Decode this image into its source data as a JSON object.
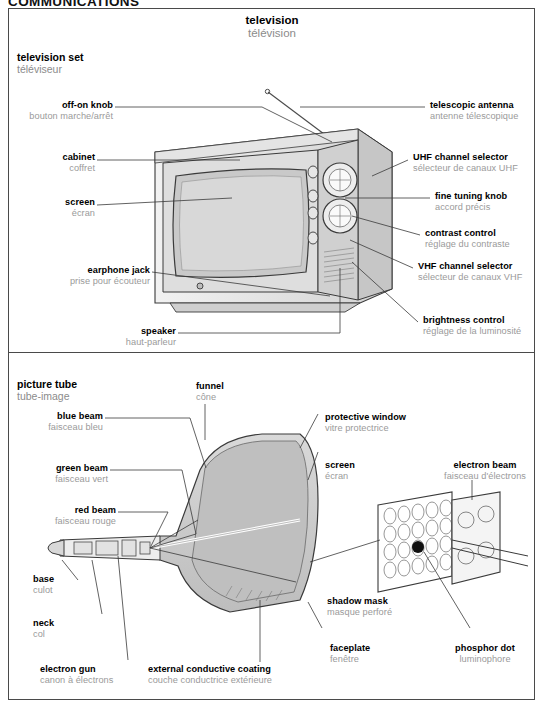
{
  "page": {
    "header": "COMMUNICATIONS",
    "title": {
      "en": "television",
      "fr": "télévision"
    }
  },
  "colors": {
    "ink": "#000000",
    "french": "#9a9a9a",
    "leader": "#3a3a3a",
    "frame": "#4a4a4a",
    "shade_light": "#e8e8e8",
    "shade_mid": "#cfcfcf",
    "shade_dark": "#a8a8a8",
    "screen_fill": "#d6d6d6"
  },
  "sections": [
    {
      "id": "television-set",
      "en": "television set",
      "fr": "téléviseur"
    },
    {
      "id": "picture-tube",
      "en": "picture tube",
      "fr": "tube-image"
    }
  ],
  "television_set": {
    "labels": [
      {
        "id": "off-on-knob",
        "en": "off-on knob",
        "fr": "bouton marche/arrêt",
        "side": "left"
      },
      {
        "id": "cabinet",
        "en": "cabinet",
        "fr": "coffret",
        "side": "left"
      },
      {
        "id": "screen",
        "en": "screen",
        "fr": "écran",
        "side": "left"
      },
      {
        "id": "earphone-jack",
        "en": "earphone jack",
        "fr": "prise pour écouteur",
        "side": "left"
      },
      {
        "id": "speaker",
        "en": "speaker",
        "fr": "haut-parleur",
        "side": "left"
      },
      {
        "id": "telescopic-antenna",
        "en": "telescopic antenna",
        "fr": "antenne télescopique",
        "side": "right"
      },
      {
        "id": "uhf-channel-selector",
        "en": "UHF channel selector",
        "fr": "sélecteur de canaux UHF",
        "side": "right"
      },
      {
        "id": "fine-tuning-knob",
        "en": "fine tuning knob",
        "fr": "accord précis",
        "side": "right"
      },
      {
        "id": "contrast-control",
        "en": "contrast control",
        "fr": "réglage du contraste",
        "side": "right"
      },
      {
        "id": "vhf-channel-selector",
        "en": "VHF channel selector",
        "fr": "sélecteur de canaux VHF",
        "side": "right"
      },
      {
        "id": "brightness-control",
        "en": "brightness control",
        "fr": "réglage de la luminosité",
        "side": "right"
      }
    ]
  },
  "picture_tube": {
    "labels": [
      {
        "id": "blue-beam",
        "en": "blue beam",
        "fr": "faisceau bleu",
        "side": "left"
      },
      {
        "id": "green-beam",
        "en": "green beam",
        "fr": "faisceau vert",
        "side": "left"
      },
      {
        "id": "red-beam",
        "en": "red beam",
        "fr": "faisceau rouge",
        "side": "left"
      },
      {
        "id": "base",
        "en": "base",
        "fr": "culot",
        "side": "left"
      },
      {
        "id": "neck",
        "en": "neck",
        "fr": "col",
        "side": "left"
      },
      {
        "id": "electron-gun",
        "en": "electron gun",
        "fr": "canon à électrons",
        "side": "left"
      },
      {
        "id": "funnel",
        "en": "funnel",
        "fr": "cône",
        "side": "top"
      },
      {
        "id": "external-conductive-coating",
        "en": "external conductive coating",
        "fr": "couche conductrice extérieure",
        "side": "bottom"
      },
      {
        "id": "protective-window",
        "en": "protective window",
        "fr": "vitre protectrice",
        "side": "right"
      },
      {
        "id": "screen",
        "en": "screen",
        "fr": "écran",
        "side": "right"
      },
      {
        "id": "shadow-mask",
        "en": "shadow mask",
        "fr": "masque perforé",
        "side": "right"
      },
      {
        "id": "faceplate",
        "en": "faceplate",
        "fr": "fenêtre",
        "side": "right"
      },
      {
        "id": "electron-beam",
        "en": "electron beam",
        "fr": "faisceau d'électrons",
        "side": "right"
      },
      {
        "id": "phosphor-dot",
        "en": "phosphor dot",
        "fr": "luminophore",
        "side": "right"
      }
    ]
  }
}
